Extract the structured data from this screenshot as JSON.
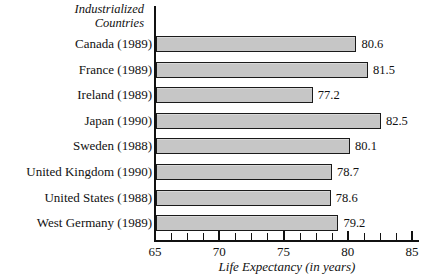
{
  "chart_data": {
    "type": "bar",
    "orientation": "horizontal",
    "title": "Industrialized Countries",
    "xlabel": "Life Expectancy (in years)",
    "ylabel": "",
    "xlim": [
      65,
      85
    ],
    "xticks": [
      65,
      70,
      75,
      80,
      85
    ],
    "xtick_labels": [
      "65",
      "70",
      "75",
      "80",
      "85"
    ],
    "minor_ticks": [
      66.25,
      67.5,
      68.75,
      71.25,
      72.5,
      73.75,
      76.25,
      77.5,
      78.75,
      81.25,
      82.5,
      83.75
    ],
    "grid": false,
    "legend": false,
    "categories": [
      "Canada (1989)",
      "France (1989)",
      "Ireland (1989)",
      "Japan (1990)",
      "Sweden (1988)",
      "United Kingdom (1990)",
      "United States (1988)",
      "West Germany (1989)"
    ],
    "values": [
      80.6,
      81.5,
      77.2,
      82.5,
      80.1,
      78.7,
      78.6,
      79.2
    ],
    "value_labels": [
      "80.6",
      "81.5",
      "77.2",
      "82.5",
      "80.1",
      "78.7",
      "78.6",
      "79.2"
    ],
    "bar_fill_color": "#c6c6c6",
    "bar_border_color": "#1a1a1a",
    "background_color": "#ffffff",
    "axis_color": "#111111"
  }
}
